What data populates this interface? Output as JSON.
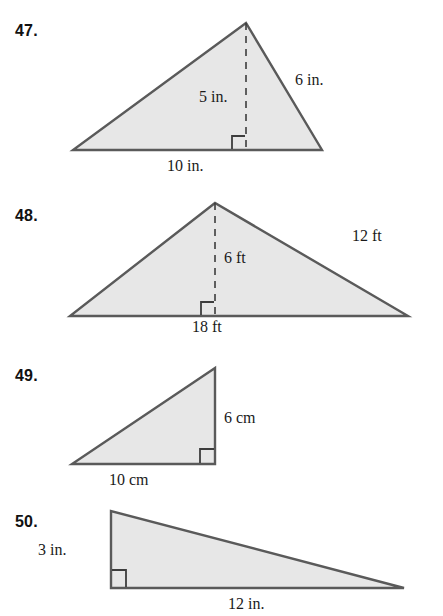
{
  "page": {
    "background_color": "#ffffff",
    "figure_fill_color": "#e7e7e7",
    "figure_stroke_color": "#5a5a5a",
    "text_color": "#1a1a1a"
  },
  "problems": [
    {
      "number": "47.",
      "shape": "triangle",
      "shape_kind": "obtuse-triangle-with-interior-height",
      "labels": {
        "height": "5 in.",
        "slant_side": "6 in.",
        "base": "10 in."
      },
      "geometry": {
        "left_vertex": [
          73,
          150
        ],
        "right_vertex": [
          322,
          150
        ],
        "apex": [
          246,
          23
        ],
        "height_foot": [
          246,
          150
        ]
      }
    },
    {
      "number": "48.",
      "shape": "triangle",
      "shape_kind": "triangle-with-interior-height",
      "labels": {
        "height": "6 ft",
        "slant_side": "12 ft",
        "base": "18 ft"
      },
      "geometry": {
        "left_vertex": [
          70,
          316
        ],
        "right_vertex": [
          408,
          316
        ],
        "apex": [
          215,
          203
        ],
        "height_foot": [
          215,
          316
        ]
      }
    },
    {
      "number": "49.",
      "shape": "triangle",
      "shape_kind": "right-triangle",
      "labels": {
        "height": "6 cm",
        "base": "10 cm"
      },
      "geometry": {
        "left_vertex": [
          72,
          464
        ],
        "right_angle_vertex": [
          215,
          464
        ],
        "top_vertex": [
          215,
          368
        ]
      }
    },
    {
      "number": "50.",
      "shape": "triangle",
      "shape_kind": "right-triangle",
      "labels": {
        "height": "3 in.",
        "base": "12 in."
      },
      "geometry": {
        "top_vertex": [
          111,
          511
        ],
        "right_angle_vertex": [
          111,
          588
        ],
        "right_vertex": [
          404,
          588
        ]
      }
    }
  ]
}
